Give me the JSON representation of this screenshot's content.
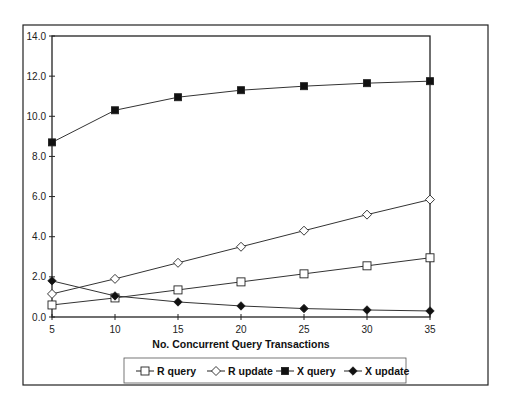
{
  "chart_data": {
    "type": "line",
    "title": "",
    "xlabel": "No. Concurrent Query Transactions",
    "ylabel": "",
    "x": [
      5,
      10,
      15,
      20,
      25,
      30,
      35
    ],
    "x_ticks": [
      "5",
      "10",
      "15",
      "20",
      "25",
      "30",
      "35"
    ],
    "y_ticks": [
      "0.0",
      "2.0",
      "4.0",
      "6.0",
      "8.0",
      "10.0",
      "12.0",
      "14.0"
    ],
    "ylim": [
      0,
      14
    ],
    "xlim": [
      5,
      35
    ],
    "grid": false,
    "legend_position": "bottom",
    "series": [
      {
        "name": "R query",
        "marker": "square-open",
        "values": [
          0.6,
          0.95,
          1.35,
          1.75,
          2.15,
          2.55,
          2.95
        ]
      },
      {
        "name": "R update",
        "marker": "diamond-open",
        "values": [
          1.15,
          1.9,
          2.7,
          3.5,
          4.3,
          5.1,
          5.85
        ]
      },
      {
        "name": "X query",
        "marker": "square-filled",
        "values": [
          8.7,
          10.3,
          10.95,
          11.3,
          11.5,
          11.65,
          11.75
        ]
      },
      {
        "name": "X update",
        "marker": "diamond-filled",
        "values": [
          1.8,
          1.05,
          0.75,
          0.55,
          0.42,
          0.35,
          0.3
        ]
      }
    ]
  },
  "colors": {
    "line": "#333333",
    "frame": "#222222",
    "marker_fill_open": "#ffffff",
    "marker_fill_solid": "#111111"
  }
}
